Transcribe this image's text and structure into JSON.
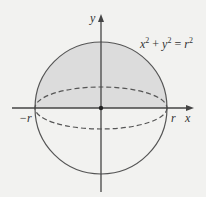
{
  "diagram": {
    "equation": {
      "x": "x",
      "plus": " + ",
      "y": "y",
      "eq": " = ",
      "r": "r",
      "exp": "2"
    },
    "axes": {
      "x_label": "x",
      "y_label": "y"
    },
    "ticks": {
      "neg_r": "−r",
      "pos_r": "r"
    },
    "colors": {
      "stroke": "#555555",
      "fill": "#d9d9d9",
      "background": "#f2f2f0"
    }
  }
}
